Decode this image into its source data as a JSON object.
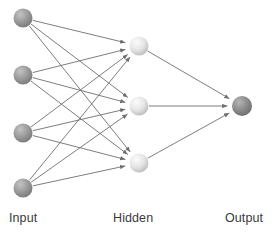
{
  "diagram": {
    "type": "diagram",
    "background_color": "#ffffff",
    "canvas": {
      "width": 280,
      "height": 235
    },
    "labels": {
      "input": "Input",
      "hidden": "Hidden",
      "output": "Output"
    },
    "label_positions": {
      "input": {
        "x": 9,
        "y": 222
      },
      "hidden": {
        "x": 113,
        "y": 222
      },
      "output": {
        "x": 225,
        "y": 222
      }
    },
    "label_color": "#3a3a3a",
    "edge_color": "#6e6e6e",
    "layers": [
      {
        "name": "input",
        "label": "Input",
        "node_count": 4,
        "node_radius": 9.5,
        "fill_color": "#9a9a9a",
        "highlight_color": "#c4c4c4",
        "shadow_color": "#7c7c7c",
        "nodes": [
          {
            "id": "i1",
            "cx": 23,
            "cy": 18
          },
          {
            "id": "i2",
            "cx": 23,
            "cy": 75
          },
          {
            "id": "i3",
            "cx": 23,
            "cy": 133
          },
          {
            "id": "i4",
            "cx": 23,
            "cy": 188
          }
        ]
      },
      {
        "name": "hidden",
        "label": "Hidden",
        "node_count": 3,
        "node_radius": 9.5,
        "fill_color": "#e2e2e2",
        "highlight_color": "#f7f7f7",
        "shadow_color": "#b8b8b8",
        "nodes": [
          {
            "id": "h1",
            "cx": 139,
            "cy": 46
          },
          {
            "id": "h2",
            "cx": 139,
            "cy": 106
          },
          {
            "id": "h3",
            "cx": 139,
            "cy": 163
          }
        ]
      },
      {
        "name": "output",
        "label": "Output",
        "node_count": 1,
        "node_radius": 10,
        "fill_color": "#8c8c8c",
        "highlight_color": "#b5b5b5",
        "shadow_color": "#6f6f6f",
        "nodes": [
          {
            "id": "o1",
            "cx": 242,
            "cy": 106
          }
        ]
      }
    ],
    "edges": [
      {
        "from": "i1",
        "to": "h1"
      },
      {
        "from": "i1",
        "to": "h2"
      },
      {
        "from": "i1",
        "to": "h3"
      },
      {
        "from": "i2",
        "to": "h1"
      },
      {
        "from": "i2",
        "to": "h2"
      },
      {
        "from": "i2",
        "to": "h3"
      },
      {
        "from": "i3",
        "to": "h1"
      },
      {
        "from": "i3",
        "to": "h2"
      },
      {
        "from": "i3",
        "to": "h3"
      },
      {
        "from": "i4",
        "to": "h1"
      },
      {
        "from": "i4",
        "to": "h2"
      },
      {
        "from": "i4",
        "to": "h3"
      },
      {
        "from": "h1",
        "to": "o1"
      },
      {
        "from": "h2",
        "to": "o1"
      },
      {
        "from": "h3",
        "to": "o1"
      }
    ],
    "edge_count": 15,
    "arrowhead": {
      "shape": "triangle",
      "color": "#6e6e6e",
      "length": 5,
      "width": 3.4
    }
  }
}
